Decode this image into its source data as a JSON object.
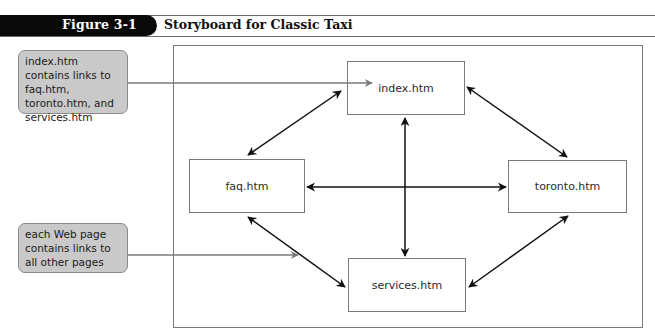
{
  "figure": {
    "label": "Figure 3-1",
    "title": "Storyboard for Classic Taxi"
  },
  "pages": [
    {
      "id": "index",
      "label": "index.htm"
    },
    {
      "id": "faq",
      "label": "faq.htm"
    },
    {
      "id": "toronto",
      "label": "toronto.htm"
    },
    {
      "id": "services",
      "label": "services.htm"
    }
  ],
  "callouts": [
    {
      "text": "index.htm contains links to faq.htm, toronto.htm, and services.htm",
      "points_to": "index.htm"
    },
    {
      "text": "each Web page contains links to all other pages",
      "points_to": "links between pages"
    }
  ],
  "links": [
    {
      "from": "index.htm",
      "to": "faq.htm",
      "bidirectional": true
    },
    {
      "from": "index.htm",
      "to": "toronto.htm",
      "bidirectional": true
    },
    {
      "from": "index.htm",
      "to": "services.htm",
      "bidirectional": true
    },
    {
      "from": "faq.htm",
      "to": "toronto.htm",
      "bidirectional": true
    },
    {
      "from": "faq.htm",
      "to": "services.htm",
      "bidirectional": true
    },
    {
      "from": "toronto.htm",
      "to": "services.htm",
      "bidirectional": true
    }
  ],
  "colors": {
    "tab_bg": "#0a0a0a",
    "callout_fill": "#c9c9c9",
    "callout_pointer": "#7a7a7a",
    "arrow": "#111111",
    "box_border": "#7a7a7a"
  }
}
